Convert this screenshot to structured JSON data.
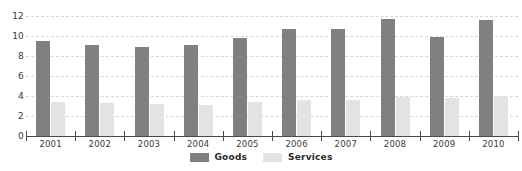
{
  "chart_data": {
    "type": "bar",
    "title": "",
    "subtitle": "",
    "xlabel": "",
    "ylabel": "",
    "categories": [
      "2001",
      "2002",
      "2003",
      "2004",
      "2005",
      "2006",
      "2007",
      "2008",
      "2009",
      "2010"
    ],
    "series": [
      {
        "name": "Goods",
        "color": "#808080",
        "values": [
          9.5,
          9.1,
          8.9,
          9.1,
          9.8,
          10.7,
          10.7,
          11.7,
          9.9,
          11.6
        ]
      },
      {
        "name": "Services",
        "color": "#e3e3e3",
        "values": [
          3.4,
          3.3,
          3.2,
          3.1,
          3.4,
          3.6,
          3.6,
          3.9,
          3.8,
          4.0
        ]
      }
    ],
    "ylim": [
      0,
      12
    ],
    "ytick_labels": [
      "0",
      "2",
      "4",
      "6",
      "8",
      "10",
      "12"
    ],
    "ytick_values": [
      0,
      2,
      4,
      6,
      8,
      10,
      12
    ],
    "grid": true,
    "grid_axis": "y",
    "grid_style": "dashed",
    "grid_color": "#d8d8d8",
    "legend_position": "bottom-center",
    "axis_color": "#4a4a4a",
    "background_color": "#ffffff"
  }
}
